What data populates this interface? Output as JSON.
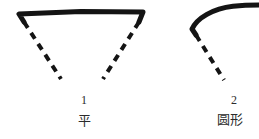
{
  "page": {
    "background_color": "#ffffff",
    "ink_color": "#141414",
    "text_color": "#2b2b2b",
    "width": 259,
    "height": 139
  },
  "figures": [
    {
      "id": "figure-1",
      "number": "1",
      "name": "平",
      "description": "hand-drawn trapezoid outline: thick solid top edge with short downturned hooks at both ends, two dashed legs converging downward",
      "solid_stroke_width": 5,
      "dashed_stroke_width": 4,
      "dash_pattern": "7 6",
      "top_edge": {
        "x1": 19,
        "y1": 14,
        "x2": 143,
        "y2": 12
      },
      "left_hook": {
        "x1": 19,
        "y1": 14,
        "x2": 24,
        "y2": 22
      },
      "right_hook": {
        "x1": 143,
        "y1": 12,
        "x2": 139,
        "y2": 22
      },
      "left_leg": {
        "x1": 24,
        "y1": 22,
        "x2": 61,
        "y2": 79
      },
      "right_leg": {
        "x1": 139,
        "y1": 22,
        "x2": 103,
        "y2": 79
      }
    },
    {
      "id": "figure-2",
      "number": "2",
      "name": "圆形",
      "description": "hand-drawn arc: thick solid curve rising from lower-left and flattening off the right edge, with a dashed radius line descending to lower-right",
      "solid_stroke_width": 5,
      "dashed_stroke_width": 4,
      "dash_pattern": "7 6",
      "arc_path": "M 192 30 C 198 18 214 8 233 6 C 245 5 254 5 259 5",
      "left_hook": {
        "x1": 192,
        "y1": 30,
        "x2": 196,
        "y2": 35
      },
      "dashed_leg": {
        "x1": 196,
        "y1": 35,
        "x2": 224,
        "y2": 80
      }
    }
  ]
}
